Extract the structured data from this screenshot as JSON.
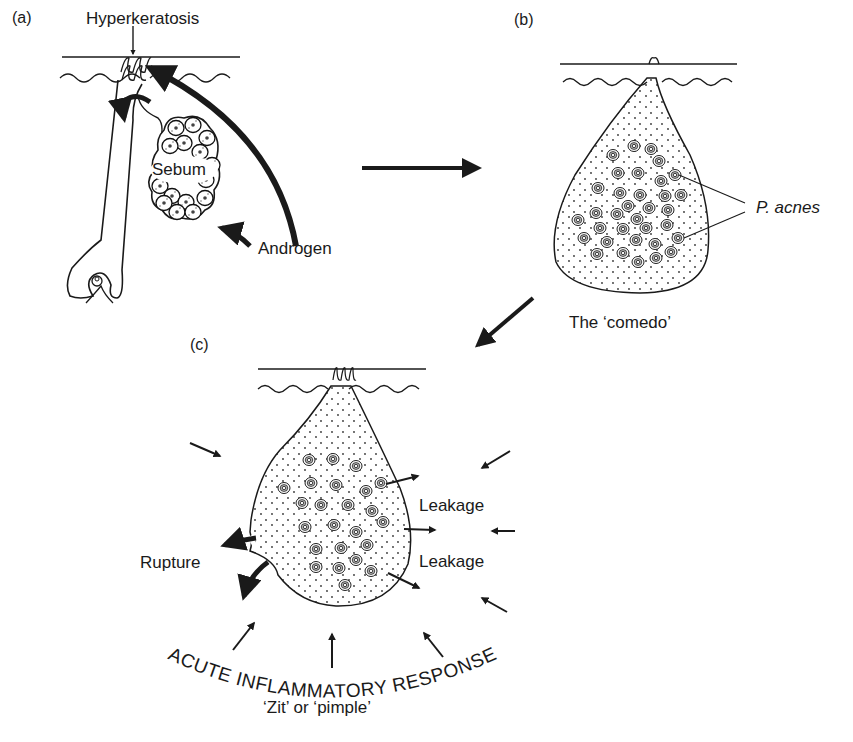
{
  "figure": {
    "panels": [
      {
        "id": "a",
        "label": "(a)",
        "annotations": {
          "hyperkeratosis": "Hyperkeratosis",
          "sebum": "Sebum",
          "androgen": "Androgen"
        }
      },
      {
        "id": "b",
        "label": "(b)",
        "annotations": {
          "bacteria": "P. acnes",
          "caption": "The ‘comedo’"
        }
      },
      {
        "id": "c",
        "label": "(c)",
        "annotations": {
          "rupture": "Rupture",
          "leakage_upper": "Leakage",
          "leakage_lower": "Leakage",
          "response": "ACUTE INFLAMMATORY RESPONSE",
          "response_caption": "‘Zit’ or ‘pimple’"
        }
      }
    ],
    "flow": [
      "a",
      "b",
      "c"
    ],
    "colors": {
      "ink": "#1a1a1a",
      "background": "#ffffff"
    }
  }
}
